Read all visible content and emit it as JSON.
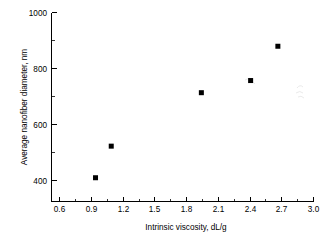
{
  "chart_data": {
    "type": "scatter",
    "title": "",
    "xlabel": "Intrinsic viscosity, dL/g",
    "ylabel": "Average nanofiber diameter, nm",
    "xlim": [
      0.5,
      3.0
    ],
    "ylim": [
      300,
      1000
    ],
    "grid": false,
    "legend": null,
    "x_ticks": [
      0.6,
      0.9,
      1.2,
      1.5,
      1.8,
      2.1,
      2.4,
      2.7,
      3.0
    ],
    "x_tick_labels": [
      "0.6",
      "0.9",
      "1.2",
      "1.5",
      "1.8",
      "2.1",
      "2.4",
      "2.7",
      "3.0"
    ],
    "y_ticks": [
      400,
      600,
      800,
      1000
    ],
    "y_tick_labels": [
      "400",
      "600",
      "800",
      "1000"
    ],
    "x_minor_ticks": [
      0.75,
      1.05,
      1.35,
      1.65,
      1.95,
      2.25,
      2.55,
      2.85
    ],
    "y_minor_ticks": [
      500,
      700,
      900
    ],
    "marker": {
      "style": "square",
      "color": "#000000",
      "size": 5
    },
    "series": [
      {
        "name": "Average nanofiber diameter",
        "points": [
          {
            "x": 0.92,
            "y": 388
          },
          {
            "x": 1.07,
            "y": 505
          },
          {
            "x": 1.93,
            "y": 703
          },
          {
            "x": 2.4,
            "y": 748
          },
          {
            "x": 2.66,
            "y": 875
          }
        ]
      }
    ],
    "x": [
      0.92,
      1.07,
      1.93,
      2.4,
      2.66
    ],
    "values": [
      388,
      505,
      703,
      748,
      875
    ]
  },
  "axes": {
    "x_axis_label": "Intrinsic viscosity, dL/g",
    "y_axis_label": "Average nanofiber diameter, nm"
  },
  "colors": {
    "background": "#ffffff",
    "axis": "#000000",
    "marker": "#000000",
    "text": "#000000"
  }
}
